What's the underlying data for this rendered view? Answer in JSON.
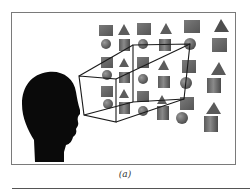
{
  "figure": {
    "caption": "(a)",
    "colors": {
      "frame": "#7a7a7a",
      "silhouette": "#0a0a0a",
      "object_fill": "#6a6a6a",
      "wireframe": "#1a1a1a",
      "rule": "#555555"
    },
    "object_types": [
      "cube",
      "pyramid",
      "sphere",
      "cylinder",
      "cone"
    ]
  }
}
